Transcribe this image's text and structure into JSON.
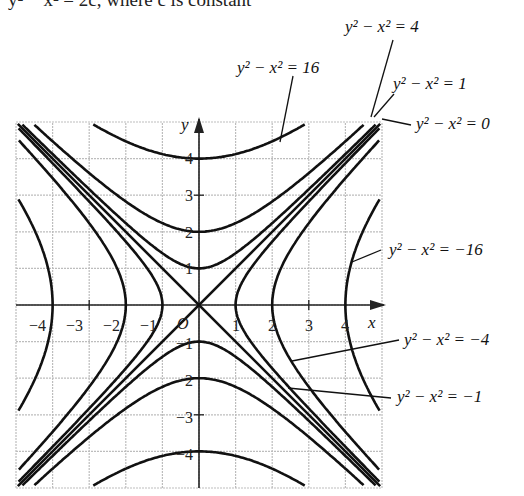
{
  "caption": "y² − x² = 2c, where c is constant",
  "chart_data": {
    "type": "line",
    "xlabel": "x",
    "ylabel": "y",
    "xlim": [
      -5,
      5
    ],
    "ylim": [
      -5,
      5
    ],
    "grid": true,
    "origin_label": "O",
    "x_ticks": [
      -4,
      -3,
      -2,
      -1,
      1,
      2,
      3,
      4
    ],
    "y_ticks": [
      -4,
      -3,
      -2,
      -1,
      1,
      2,
      3,
      4
    ],
    "series": [
      {
        "name": "y² − x² = 16",
        "k": 16,
        "vertex": [
          0,
          4
        ]
      },
      {
        "name": "y² − x² = 4",
        "k": 4,
        "vertex": [
          0,
          2
        ]
      },
      {
        "name": "y² − x² = 1",
        "k": 1,
        "vertex": [
          0,
          1
        ]
      },
      {
        "name": "y² − x² = 0",
        "k": 0,
        "lines": [
          "y = x",
          "y = -x"
        ]
      },
      {
        "name": "y² − x² = −1",
        "k": -1,
        "vertex": [
          1,
          0
        ]
      },
      {
        "name": "y² − x² = −4",
        "k": -4,
        "vertex": [
          2,
          0
        ]
      },
      {
        "name": "y² − x² = −16",
        "k": -16,
        "vertex": [
          4,
          0
        ]
      }
    ]
  },
  "labels": {
    "k4": "y² − x² = 4",
    "k16": "y² − x² = 16",
    "k1": "y² − x² = 1",
    "k0": "y² − x² = 0",
    "km16": "y² − x² = −16",
    "km4": "y² − x² = −4",
    "km1": "y² − x² = −1",
    "xaxis": "x",
    "yaxis": "y",
    "origin": "O"
  },
  "ticks": {
    "x": [
      "−4",
      "−3",
      "−2",
      "−1",
      "1",
      "2",
      "3",
      "4"
    ],
    "y": [
      "4",
      "3",
      "2",
      "1",
      "−1",
      "−2",
      "−3",
      "−4"
    ]
  }
}
